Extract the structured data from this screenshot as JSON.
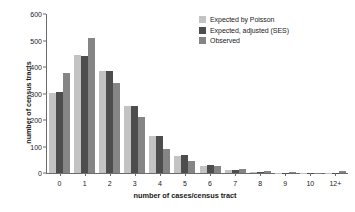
{
  "chart_data": {
    "type": "bar",
    "title": "",
    "subtitle": "",
    "xlabel": "number of cases/census tract",
    "ylabel": "number of census tracts",
    "categories": [
      "0",
      "1",
      "2",
      "3",
      "4",
      "5",
      "6",
      "7",
      "8",
      "9",
      "10",
      "12+"
    ],
    "ylim": [
      0,
      600
    ],
    "yticks": [
      0,
      100,
      200,
      300,
      400,
      500,
      600
    ],
    "grid": false,
    "legend_position": "top-right",
    "series": [
      {
        "name": "Expected by Poisson",
        "color": "#c3c3c3",
        "values": [
          303,
          444,
          385,
          254,
          138,
          66,
          27,
          10,
          5,
          1,
          1,
          1
        ]
      },
      {
        "name": "Expected, adjusted (SES)",
        "color": "#4d4d4d",
        "values": [
          307,
          443,
          384,
          253,
          138,
          68,
          29,
          10,
          5,
          1,
          1,
          1
        ]
      },
      {
        "name": "Observed",
        "color": "#858585",
        "values": [
          378,
          508,
          340,
          210,
          90,
          44,
          28,
          17,
          6,
          2,
          1,
          8
        ]
      }
    ]
  }
}
